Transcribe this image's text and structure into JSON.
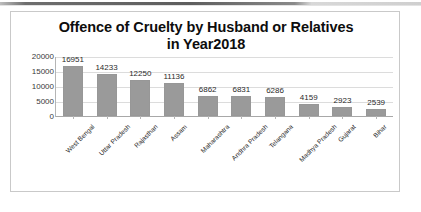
{
  "scan": {
    "edge_artifact": "page-scan-dark-band"
  },
  "chart_data": {
    "type": "bar",
    "title": "Offence of Cruelty by Husband or Relatives in Year2018",
    "title_line1": "Offence of Cruelty by Husband or Relatives",
    "title_line2": "in Year2018",
    "xlabel": "",
    "ylabel": "",
    "ylim": [
      0,
      20000
    ],
    "yticks": [
      20000,
      15000,
      10000,
      5000,
      0
    ],
    "ytick_labels": [
      "20000",
      "15000",
      "10000",
      "5000",
      "0"
    ],
    "grid": true,
    "legend": false,
    "bar_color": "#9a9a9a",
    "categories": [
      "West Bengal",
      "Uttar Pradesh",
      "Rajasthan",
      "Assam",
      "Maharashtra",
      "Andhra Pradesh",
      "Telangana",
      "Madhya Pradesh",
      "Gujarat",
      "Bihar"
    ],
    "values": [
      16951,
      14233,
      12250,
      11136,
      6862,
      6831,
      6286,
      4159,
      2923,
      2539
    ],
    "data_labels": [
      "16951",
      "14233",
      "12250",
      "11136",
      "6862",
      "6831",
      "6286",
      "4159",
      "2923",
      "2539"
    ]
  }
}
